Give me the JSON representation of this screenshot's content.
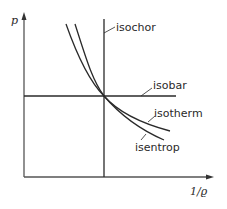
{
  "diagram": {
    "type": "p-v state change diagram",
    "axes": {
      "y_label": "p",
      "x_label": "1/ϱ"
    },
    "curves": [
      {
        "name": "isochor",
        "label": "isochor"
      },
      {
        "name": "isobar",
        "label": "isobar"
      },
      {
        "name": "isotherm",
        "label": "isotherm"
      },
      {
        "name": "isentrop",
        "label": "isentrop"
      }
    ],
    "colors": {
      "line": "#2a2a2a",
      "axis": "#555555",
      "background": "#ffffff"
    }
  }
}
